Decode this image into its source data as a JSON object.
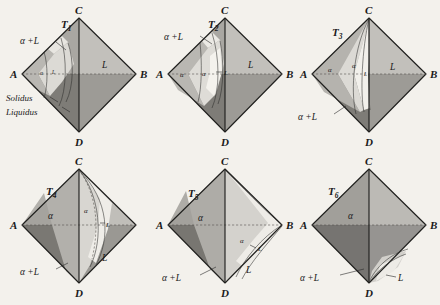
{
  "figure": {
    "caption_present": false,
    "background_color": "#f3f1ec",
    "ink_color": "#1a1a1a",
    "panel_count": 6,
    "projection": "tetrahedron-rhombic"
  },
  "vertices": {
    "a": "A",
    "b": "B",
    "c": "C",
    "d": "D"
  },
  "phases": {
    "alpha": "α",
    "liquid": "L",
    "two_phase": "α +L",
    "alpha_plain": "α",
    "l_plain": "L"
  },
  "curves": {
    "solidus": "Solidus",
    "liquidus": "Liquidus"
  },
  "panels": [
    {
      "id": "t1",
      "temp_label": "T",
      "temp_sub": "1",
      "row": 0,
      "col": 0,
      "show_vertex_a": true,
      "show_vertex_b": true,
      "show_vertex_c": true,
      "show_vertex_d": true,
      "show_solidus_liquidus": true,
      "labels": {
        "alpha_l": "α +L",
        "liquid": "L",
        "alpha_small": "α",
        "l_small": "L"
      },
      "description": "Highest temperature: thin sliver of alpha near A vertex, liquid fills nearly all of tetrahedron"
    },
    {
      "id": "t2",
      "temp_label": "T",
      "temp_sub": "2",
      "row": 0,
      "col": 1,
      "show_vertex_a": true,
      "show_vertex_b": true,
      "show_vertex_c": true,
      "show_vertex_d": true,
      "show_solidus_liquidus": false,
      "labels": {
        "alpha_l": "α +L",
        "liquid": "L",
        "alpha_small": "α",
        "alpha_small2": "α",
        "l_small": "L"
      },
      "description": "Alpha region grown from A vertex; two-phase band widened"
    },
    {
      "id": "t3",
      "temp_label": "T",
      "temp_sub": "3",
      "row": 0,
      "col": 2,
      "show_vertex_a": true,
      "show_vertex_b": true,
      "show_vertex_c": true,
      "show_vertex_d": true,
      "show_solidus_liquidus": false,
      "labels": {
        "alpha_l": "α +L",
        "liquid": "L",
        "alpha_small": "α",
        "alpha_small2": "α",
        "l_small": "L"
      },
      "description": "Alpha occupies left third; liquidus surface has swept toward centre"
    },
    {
      "id": "t4",
      "temp_label": "T",
      "temp_sub": "4",
      "row": 1,
      "col": 0,
      "show_vertex_a": true,
      "show_vertex_b": false,
      "show_vertex_c": true,
      "show_vertex_d": true,
      "show_solidus_liquidus": false,
      "labels": {
        "alpha_l": "α +L",
        "liquid": "L",
        "alpha_small": "α",
        "alpha_small2": "α",
        "l_small": "L"
      },
      "description": "Alpha now covers left half; liquid confined to lower right near B-D edge"
    },
    {
      "id": "t5",
      "temp_label": "T",
      "temp_sub": "5",
      "row": 1,
      "col": 1,
      "show_vertex_a": true,
      "show_vertex_b": true,
      "show_vertex_c": true,
      "show_vertex_d": true,
      "show_solidus_liquidus": false,
      "labels": {
        "alpha_l": "α +L",
        "liquid": "L",
        "alpha_small": "α",
        "alpha_small2": "α",
        "l_small": "L"
      },
      "description": "Alpha dominant; residual liquid wedge pinned to lower right corner"
    },
    {
      "id": "t6",
      "temp_label": "T",
      "temp_sub": "6",
      "row": 1,
      "col": 2,
      "show_vertex_a": true,
      "show_vertex_b": true,
      "show_vertex_c": true,
      "show_vertex_d": true,
      "show_solidus_liquidus": false,
      "labels": {
        "alpha_l": "α +L",
        "liquid": "L",
        "alpha_small": "α",
        "l_small": "L"
      },
      "description": "Lowest temperature: nearly all alpha, tiny liquid lens remaining just above D"
    }
  ]
}
